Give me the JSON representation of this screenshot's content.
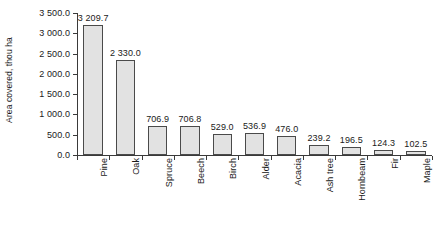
{
  "chart_data": {
    "type": "bar",
    "title": "",
    "xlabel": "",
    "ylabel": "Area covered, thou ha",
    "ylim": [
      0,
      3500
    ],
    "ytick_step": 500,
    "grid": false,
    "legend": "none",
    "orientation": "vertical",
    "bar_color": "#e2e2e2",
    "bar_border_color": "#4a4a4a",
    "axis_color": "#3a3a3a",
    "value_labels_shown": true,
    "thousands_separator": " ",
    "decimal_places": 1,
    "xtick_label_rotation": 90,
    "categories": [
      "Pine",
      "Oak",
      "Spruce",
      "Beech",
      "Birch",
      "Alder",
      "Acacia",
      "Ash tree",
      "Hornbeam",
      "Fir",
      "Maple"
    ],
    "values": [
      3209.7,
      2330.0,
      706.9,
      706.8,
      529.0,
      536.9,
      476.0,
      239.2,
      196.5,
      124.3,
      102.5
    ],
    "value_labels": [
      "3 209.7",
      "2 330.0",
      "706.9",
      "706.8",
      "529.0",
      "536.9",
      "476.0",
      "239.2",
      "196.5",
      "124.3",
      "102.5"
    ],
    "ytick_labels": [
      "0.0",
      "500.0",
      "1 000.0",
      "1 500.0",
      "2 000.0",
      "2 500.0",
      "3 000.0",
      "3 500.0"
    ],
    "ytick_values": [
      0,
      500,
      1000,
      1500,
      2000,
      2500,
      3000,
      3500
    ]
  }
}
